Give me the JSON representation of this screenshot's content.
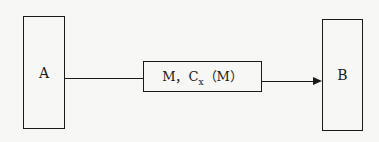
{
  "diagram": {
    "nodes": [
      {
        "id": "A",
        "label": "A"
      },
      {
        "id": "channel",
        "label_main": "M，C",
        "label_sub": "x",
        "label_tail": "（M）"
      },
      {
        "id": "B",
        "label": "B"
      }
    ],
    "edges": [
      {
        "from": "A",
        "to": "channel",
        "arrow": false
      },
      {
        "from": "channel",
        "to": "B",
        "arrow": true
      }
    ]
  }
}
